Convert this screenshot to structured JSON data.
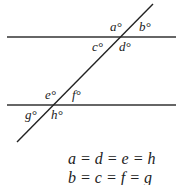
{
  "diagram": {
    "angle_labels": {
      "a": "a°",
      "b": "b°",
      "c": "c°",
      "d": "d°",
      "e": "e°",
      "f": "f°",
      "g": "g°",
      "h": "h°"
    },
    "equations": [
      "a = d = e = h",
      "b = c = f = g"
    ]
  }
}
